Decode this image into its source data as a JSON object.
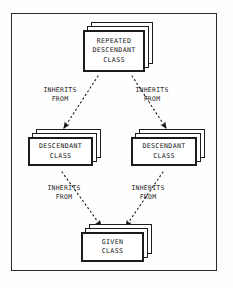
{
  "figure": {
    "frame": {
      "style": "thin-rectangle-border",
      "color": "#2b2b2b"
    },
    "background_color": "#fdfdfc",
    "ink_color": "#161616"
  },
  "nodes": [
    {
      "id": "repeated-descendant",
      "label": "REPEATED\nDESCENDANT\nCLASS",
      "lines": [
        "REPEATED",
        "DESCENDANT",
        "CLASS"
      ],
      "shape": "stacked-boxes",
      "stack_count": 3
    },
    {
      "id": "descendant-left",
      "label": "DESCENDANT\nCLASS",
      "lines": [
        "DESCENDANT",
        "CLASS"
      ],
      "shape": "stacked-boxes",
      "stack_count": 3
    },
    {
      "id": "descendant-right",
      "label": "DESCENDANT\nCLASS",
      "lines": [
        "DESCENDANT",
        "CLASS"
      ],
      "shape": "stacked-boxes",
      "stack_count": 3
    },
    {
      "id": "given",
      "label": "GIVEN\nCLASS",
      "lines": [
        "GIVEN",
        "CLASS"
      ],
      "shape": "stacked-boxes",
      "stack_count": 3
    }
  ],
  "edges": [
    {
      "id": "edge-top-left",
      "from": "repeated-descendant",
      "to": "descendant-left",
      "label": "INHERITS\nFROM",
      "style": "dotted",
      "arrowhead": "solid-filled"
    },
    {
      "id": "edge-top-right",
      "from": "repeated-descendant",
      "to": "descendant-right",
      "label": "INHERITS\nFROM",
      "style": "dotted",
      "arrowhead": "solid-filled"
    },
    {
      "id": "edge-bottom-left",
      "from": "descendant-left",
      "to": "given",
      "label": "INHERITS\nFROM",
      "style": "dotted",
      "arrowhead": "solid-filled"
    },
    {
      "id": "edge-bottom-right",
      "from": "descendant-right",
      "to": "given",
      "label": "INHERITS\nFROM",
      "style": "dotted",
      "arrowhead": "solid-filled"
    }
  ]
}
